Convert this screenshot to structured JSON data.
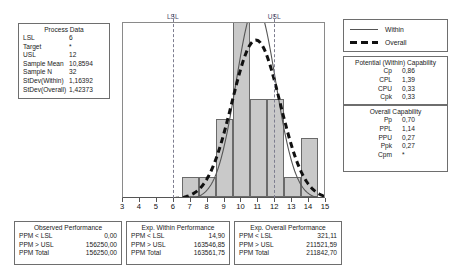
{
  "process_data": {
    "title": "Process Data",
    "rows": [
      {
        "label": "LSL",
        "value": "6"
      },
      {
        "label": "Target",
        "value": "*"
      },
      {
        "label": "USL",
        "value": "12"
      },
      {
        "label": "Sample Mean",
        "value": "10,8594"
      },
      {
        "label": "Sample N",
        "value": "32"
      },
      {
        "label": "StDev(Within)",
        "value": "1,16392"
      },
      {
        "label": "StDev(Overall)",
        "value": "1,42373"
      }
    ]
  },
  "legend": {
    "items": [
      {
        "label": "Within",
        "style": "solid",
        "color": "#555555"
      },
      {
        "label": "Overall",
        "style": "dashed",
        "color": "#111111"
      }
    ]
  },
  "within_capability": {
    "title": "Potential (Within) Capability",
    "rows": [
      {
        "label": "Cp",
        "value": "0,86"
      },
      {
        "label": "CPL",
        "value": "1,39"
      },
      {
        "label": "CPU",
        "value": "0,33"
      },
      {
        "label": "Cpk",
        "value": "0,33"
      }
    ]
  },
  "overall_capability": {
    "title": "Overall Capability",
    "rows": [
      {
        "label": "Pp",
        "value": "0,70"
      },
      {
        "label": "PPL",
        "value": "1,14"
      },
      {
        "label": "PPU",
        "value": "0,27"
      },
      {
        "label": "Ppk",
        "value": "0,27"
      },
      {
        "label": "Cpm",
        "value": "*"
      }
    ]
  },
  "observed_performance": {
    "title": "Observed Performance",
    "rows": [
      {
        "label": "PPM < LSL",
        "value": "0,00"
      },
      {
        "label": "PPM > USL",
        "value": "156250,00"
      },
      {
        "label": "PPM Total",
        "value": "156250,00"
      }
    ]
  },
  "exp_within_performance": {
    "title": "Exp. Within Performance",
    "rows": [
      {
        "label": "PPM < LSL",
        "value": "14,90"
      },
      {
        "label": "PPM > USL",
        "value": "163546,85"
      },
      {
        "label": "PPM Total",
        "value": "163561,75"
      }
    ]
  },
  "exp_overall_performance": {
    "title": "Exp. Overall Performance",
    "rows": [
      {
        "label": "PPM < LSL",
        "value": "321,11"
      },
      {
        "label": "PPM > USL",
        "value": "211521,59"
      },
      {
        "label": "PPM Total",
        "value": "211842,70"
      }
    ]
  },
  "chart_data": {
    "type": "bar",
    "title": "",
    "xlabel": "",
    "ylabel": "",
    "xlim": [
      3,
      15
    ],
    "ylim": [
      0,
      9
    ],
    "grid": false,
    "tick_labels": [
      "3",
      "4",
      "5",
      "6",
      "7",
      "8",
      "9",
      "10",
      "11",
      "12",
      "13",
      "14",
      "15"
    ],
    "bin_edges": [
      6.5,
      7.5,
      8.5,
      9.5,
      10.5,
      11.5,
      12.5,
      13.5,
      14.5
    ],
    "bin_centers": [
      7,
      8,
      9,
      10,
      11,
      12,
      13,
      14
    ],
    "counts": [
      1,
      1,
      4,
      9,
      5,
      5,
      1,
      3
    ],
    "spec_lines": [
      {
        "name": "LSL",
        "label": "LSL",
        "value": 6,
        "color": "#7d7d8f",
        "style": "dashed"
      },
      {
        "name": "USL",
        "label": "USL",
        "value": 12,
        "color": "#7d7d8f",
        "style": "dashed"
      }
    ],
    "curves": [
      {
        "name": "Within",
        "mean": 10.8594,
        "sd": 1.16392,
        "style": "solid",
        "color": "#555555"
      },
      {
        "name": "Overall",
        "mean": 10.8594,
        "sd": 1.42373,
        "style": "dashed",
        "color": "#111111"
      }
    ],
    "bar_color": "#c9c9c9",
    "bar_edge_color": "#6a6a6a"
  }
}
